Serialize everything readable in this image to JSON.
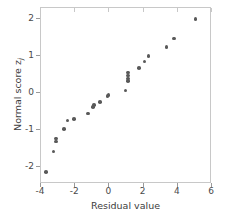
{
  "chart_data": {
    "type": "scatter",
    "title": "",
    "xlabel": "Residual value",
    "ylabel": "Normal score z",
    "ylabel_subscript": "j",
    "xlim": [
      -4,
      6
    ],
    "ylim": [
      -2.45,
      2.3
    ],
    "xticks": [
      -4,
      -2,
      0,
      2,
      4,
      6
    ],
    "xtick_labels": [
      "-4",
      "-2",
      "0",
      "2",
      "4",
      "6"
    ],
    "yticks": [
      2,
      1,
      0,
      -1,
      -2
    ],
    "ytick_labels": [
      "2",
      "1",
      "0",
      "-1",
      "-2"
    ],
    "grid": false,
    "legend": null,
    "marker": {
      "shape": "circle",
      "color": "#595959",
      "size": 3.6
    },
    "series": [
      {
        "name": "normal probability plot",
        "x": [
          -3.65,
          -3.2,
          -3.05,
          -3.05,
          -2.6,
          -2.4,
          -2.0,
          -1.2,
          -0.9,
          -0.85,
          -0.5,
          -0.05,
          0.0,
          1.0,
          1.15,
          1.15,
          1.15,
          1.15,
          1.8,
          2.1,
          2.35,
          3.4,
          3.85,
          5.1
        ],
        "y": [
          -2.15,
          -1.6,
          -1.25,
          -1.33,
          -1.0,
          -0.76,
          -0.72,
          -0.57,
          -0.4,
          -0.35,
          -0.27,
          -0.11,
          -0.08,
          0.05,
          0.3,
          0.37,
          0.45,
          0.53,
          0.66,
          0.83,
          0.97,
          1.22,
          1.45,
          1.97
        ]
      }
    ]
  },
  "axes": {
    "frame_color": "#c8c8c8",
    "tick_color": "#9a9a9a",
    "text_color": "#4a4a4a"
  }
}
